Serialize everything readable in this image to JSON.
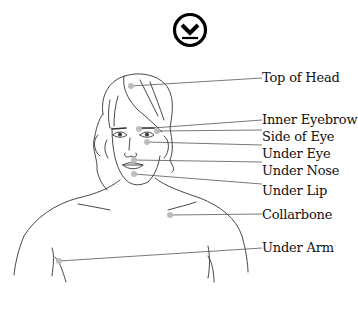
{
  "logo": {
    "icon": "circled-down-chevron-icon"
  },
  "diagram": {
    "dot_color": "#bdbdbd",
    "line_color": "#555555",
    "points": [
      {
        "label": "Top of Head",
        "dot": [
          131,
          86
        ],
        "label_pos": [
          262,
          66
        ]
      },
      {
        "label": "Inner Eyebrow",
        "dot": [
          139,
          129
        ],
        "label_pos": [
          262,
          110
        ]
      },
      {
        "label": "Side of Eye",
        "dot": [
          157,
          131
        ],
        "label_pos": [
          262,
          129
        ]
      },
      {
        "label": "Under Eye",
        "dot": [
          147,
          142
        ],
        "label_pos": [
          262,
          146
        ]
      },
      {
        "label": "Under Nose",
        "dot": [
          134,
          160
        ],
        "label_pos": [
          262,
          163
        ]
      },
      {
        "label": "Under Lip",
        "dot": [
          134,
          174
        ],
        "label_pos": [
          262,
          182
        ]
      },
      {
        "label": "Collarbone",
        "dot": [
          170,
          215
        ],
        "label_pos": [
          262,
          213
        ]
      },
      {
        "label": "Under Arm",
        "dot": [
          59,
          261
        ],
        "label_pos": [
          262,
          245
        ]
      }
    ]
  }
}
